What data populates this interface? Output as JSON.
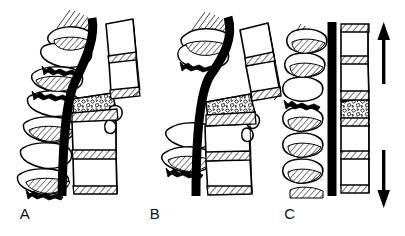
{
  "figure": {
    "type": "line-art-medical-illustration",
    "background_color": "#ffffff",
    "ink_color": "#000000",
    "panel_count": 3
  },
  "panels": [
    {
      "label": "A",
      "label_x": 25,
      "label_y": 219,
      "caption": "Burst fracture with retropulsed fragment compressing the spinal cord",
      "origin_x": 10,
      "features": {
        "spinal_cord": "anteriorly deviated dark band",
        "fractured_body": "comminuted stippled vertebral body",
        "retropulsed_fragment": "bone fragment displaced posteriorly",
        "posterior_elements": "hatched spinous processes with interspinous widening",
        "discs": "diagonally hatched intervertebral discs"
      }
    },
    {
      "label": "B",
      "label_x": 155,
      "label_y": 219,
      "caption": "Increased kyphotic angulation with posterior element distraction",
      "origin_x": 148,
      "features": {
        "spinal_cord": "sharply angulated dark band",
        "fractured_body": "comminuted stippled vertebral body",
        "retropulsed_fragment": "bone fragment displaced posteriorly",
        "posterior_elements": "widely separated spinous processes",
        "discs": "diagonally hatched intervertebral discs"
      }
    },
    {
      "label": "C",
      "label_x": 290,
      "label_y": 219,
      "caption": "Realignment of the spinal column by axial distraction",
      "origin_x": 283,
      "features": {
        "spinal_cord": "straight vertical dark band",
        "fractured_body": "partially reduced stippled vertebral body",
        "posterior_elements": "realigned hatched spinous processes",
        "discs": "diagonally hatched intervertebral discs"
      }
    }
  ],
  "annotations": {
    "arrows": [
      {
        "name": "distraction-arrow-up",
        "direction": "up",
        "meaning": "axial distraction force (cephalad)",
        "x": 375,
        "y_top": 24,
        "y_bottom": 84
      },
      {
        "name": "distraction-arrow-down",
        "direction": "down",
        "meaning": "axial distraction force (caudad)",
        "x": 375,
        "y_top": 152,
        "y_bottom": 206
      }
    ]
  },
  "legend_text": {
    "a": "A",
    "b": "B",
    "c": "C"
  }
}
